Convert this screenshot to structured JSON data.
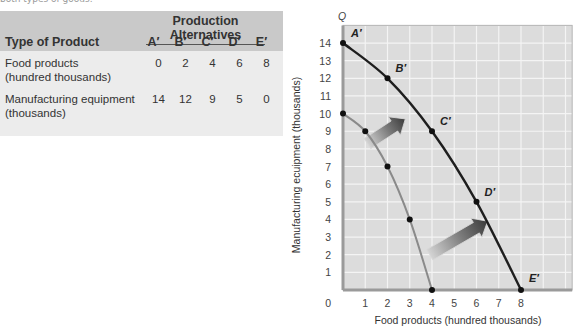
{
  "caption": "both types of goods.",
  "table": {
    "group_header": "Production Alternatives",
    "row_header": "Type of Product",
    "columns": [
      "A′",
      "B′",
      "C′",
      "D′",
      "E′"
    ],
    "rows": [
      {
        "label_line1": "Food products",
        "label_line2": "(hundred thousands)",
        "values": [
          "0",
          "2",
          "4",
          "6",
          "8"
        ]
      },
      {
        "label_line1": "Manufacturing equipment",
        "label_line2": "(thousands)",
        "values": [
          "14",
          "12",
          "9",
          "5",
          "0"
        ]
      }
    ]
  },
  "chart_data": {
    "type": "line",
    "title": "",
    "xlabel": "Food products (hundred thousands)",
    "ylabel": "Manufacturing ecuipment (thousands)",
    "x_axis_symbol": "Q",
    "y_axis_symbol": "Q",
    "xlim": [
      0,
      10.3
    ],
    "ylim": [
      0,
      15
    ],
    "x_ticks": [
      0,
      1,
      2,
      3,
      4,
      5,
      6,
      7,
      8
    ],
    "y_ticks": [
      1,
      2,
      3,
      4,
      5,
      6,
      7,
      8,
      9,
      10,
      11,
      12,
      13,
      14
    ],
    "grid": true,
    "series": [
      {
        "name": "Original production possibilities curve",
        "color": "#8a8a8a",
        "x": [
          0,
          1,
          2,
          3,
          4
        ],
        "y": [
          10,
          9,
          7,
          4,
          0
        ]
      },
      {
        "name": "Expanded production possibilities curve",
        "color": "#1e1e1e",
        "x": [
          0,
          2,
          4,
          6,
          8
        ],
        "y": [
          14,
          12,
          9,
          5,
          0
        ],
        "point_labels": [
          "A′",
          "B′",
          "C′",
          "D′",
          "E′"
        ]
      }
    ],
    "annotations": [
      {
        "type": "arrow",
        "description": "outward shift arrow (upper)",
        "from": [
          1.1,
          8.3
        ],
        "to": [
          2.8,
          9.7
        ]
      },
      {
        "type": "arrow",
        "description": "outward shift arrow (lower)",
        "from": [
          3.9,
          2.0
        ],
        "to": [
          6.5,
          3.9
        ]
      }
    ],
    "colors": {
      "plot_bg": "#dcdcdc",
      "grid": "#f4f4f4",
      "axis": "#9a9a9a"
    }
  }
}
